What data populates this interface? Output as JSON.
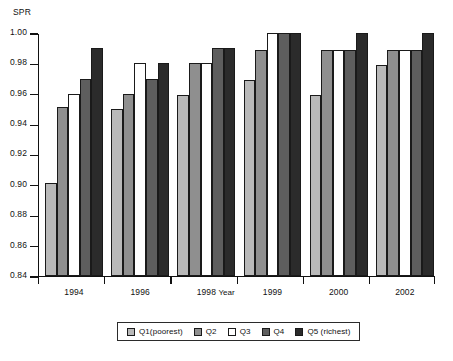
{
  "chart_data": {
    "type": "bar",
    "title": "",
    "subtitle": "",
    "xlabel": "Year",
    "ylabel": "SPR",
    "ylim": [
      0.84,
      1.0
    ],
    "ytick_labels": [
      "1.00",
      "0.98",
      "0.96",
      "0.94",
      "0.92",
      "0.90",
      "0.88",
      "0.86",
      "0.84"
    ],
    "yticks": [
      1.0,
      0.98,
      0.96,
      0.94,
      0.92,
      0.9,
      0.88,
      0.86,
      0.84
    ],
    "grid": false,
    "legend_position": "bottom-center",
    "categories": [
      "1994",
      "1996",
      "1998",
      "1999",
      "2000",
      "2002"
    ],
    "series": [
      {
        "name": "Q1(poorest)",
        "color": "#b9b9b9",
        "values": [
          0.901,
          0.95,
          0.959,
          0.969,
          0.959,
          0.979
        ]
      },
      {
        "name": "Q2",
        "color": "#8f8f8f",
        "values": [
          0.951,
          0.96,
          0.98,
          0.989,
          0.989,
          0.989
        ]
      },
      {
        "name": "Q3",
        "color": "#ffffff",
        "values": [
          0.96,
          0.98,
          0.98,
          1.0,
          0.989,
          0.989
        ]
      },
      {
        "name": "Q4",
        "color": "#5e5e5e",
        "values": [
          0.97,
          0.97,
          0.99,
          1.0,
          0.989,
          0.989
        ]
      },
      {
        "name": "Q5 (richest)",
        "color": "#2b2b2b",
        "values": [
          0.99,
          0.98,
          0.99,
          1.0,
          1.0,
          1.0
        ]
      }
    ]
  },
  "axes": {
    "y_title": "SPR",
    "x_title": "Year"
  },
  "legend": {
    "items": [
      {
        "label": "Q1(poorest)",
        "color": "#b9b9b9"
      },
      {
        "label": "Q2",
        "color": "#8f8f8f"
      },
      {
        "label": "Q3",
        "color": "#ffffff"
      },
      {
        "label": "Q4",
        "color": "#5e5e5e"
      },
      {
        "label": "Q5 (richest)",
        "color": "#2b2b2b"
      }
    ]
  }
}
